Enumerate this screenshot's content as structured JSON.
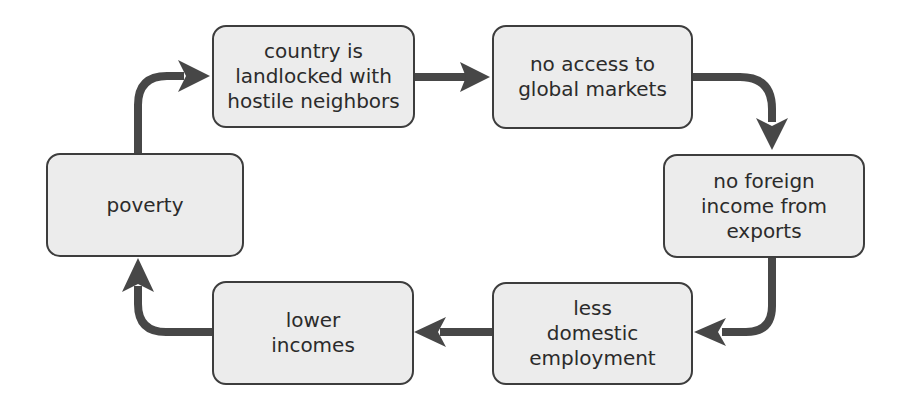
{
  "diagram": {
    "colors": {
      "node_fill": "#ececec",
      "node_border": "#3d3d3d",
      "arrow": "#474747",
      "text": "#2b2b2b",
      "background": "#ffffff"
    },
    "nodes": [
      {
        "id": "country",
        "label": "country is\nlandlocked with\nhostile neighbors"
      },
      {
        "id": "no-access",
        "label": "no access to\nglobal markets"
      },
      {
        "id": "no-foreign-income",
        "label": "no foreign\nincome from\nexports"
      },
      {
        "id": "less-employment",
        "label": "less\ndomestic\nemployment"
      },
      {
        "id": "lower-incomes",
        "label": "lower\nincomes"
      },
      {
        "id": "poverty",
        "label": "poverty"
      }
    ],
    "edges": [
      {
        "from": "country",
        "to": "no-access"
      },
      {
        "from": "no-access",
        "to": "no-foreign-income"
      },
      {
        "from": "no-foreign-income",
        "to": "less-employment"
      },
      {
        "from": "less-employment",
        "to": "lower-incomes"
      },
      {
        "from": "lower-incomes",
        "to": "poverty"
      },
      {
        "from": "poverty",
        "to": "country"
      }
    ]
  }
}
